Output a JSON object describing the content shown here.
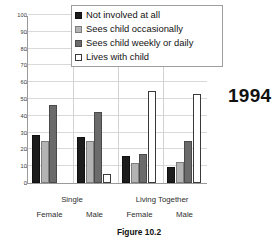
{
  "chart_data": {
    "type": "bar",
    "title": "",
    "subtitle": "",
    "xlabel": "",
    "ylabel": "",
    "ylim": [
      0,
      100
    ],
    "yticks": [
      0,
      10,
      20,
      30,
      40,
      50,
      60,
      70,
      80,
      90,
      100
    ],
    "grid": true,
    "legend_position": "top-center",
    "categories": [
      "Female",
      "Male",
      "Female",
      "Male"
    ],
    "category_groups": [
      {
        "label": "Single",
        "members": [
          "Female",
          "Male"
        ]
      },
      {
        "label": "Living Together",
        "members": [
          "Female",
          "Male"
        ]
      }
    ],
    "series": [
      {
        "name": "Not involved at all",
        "color": "#1c1c1c",
        "values": [
          28.3,
          27.6,
          15.8,
          9.5
        ]
      },
      {
        "name": "Sees child occasionally",
        "color": "#b3b3b3",
        "values": [
          25.1,
          25.0,
          12.1,
          12.4
        ]
      },
      {
        "name": "Sees child weekly or daily",
        "color": "#6b6b6b",
        "values": [
          46.3,
          42.1,
          17.2,
          24.8
        ]
      },
      {
        "name": "Lives with child",
        "color": "#ffffff",
        "values": [
          0,
          5.3,
          54.5,
          53.0
        ]
      }
    ],
    "annotations": [
      {
        "name": "year",
        "text": "1994"
      }
    ],
    "caption": "Figure 10.2"
  },
  "legend": {
    "items": [
      {
        "label": "Not involved at all",
        "swatch": "#1c1c1c"
      },
      {
        "label": "Sees child occasionally",
        "swatch": "#b3b3b3"
      },
      {
        "label": "Sees child weekly or daily",
        "swatch": "#6b6b6b"
      },
      {
        "label": "Lives with child",
        "swatch": "#ffffff"
      }
    ]
  },
  "axis": {
    "y_tick_labels": [
      "100",
      "90",
      "80",
      "70",
      "60",
      "50",
      "40",
      "30",
      "20",
      "10",
      "0"
    ]
  },
  "xaxis": {
    "major": [
      "Single",
      "Living Together"
    ],
    "minor": [
      "Female",
      "Male",
      "Female",
      "Male"
    ]
  },
  "annotation": {
    "year": "1994"
  },
  "caption": {
    "text": "Figure 10.2"
  }
}
